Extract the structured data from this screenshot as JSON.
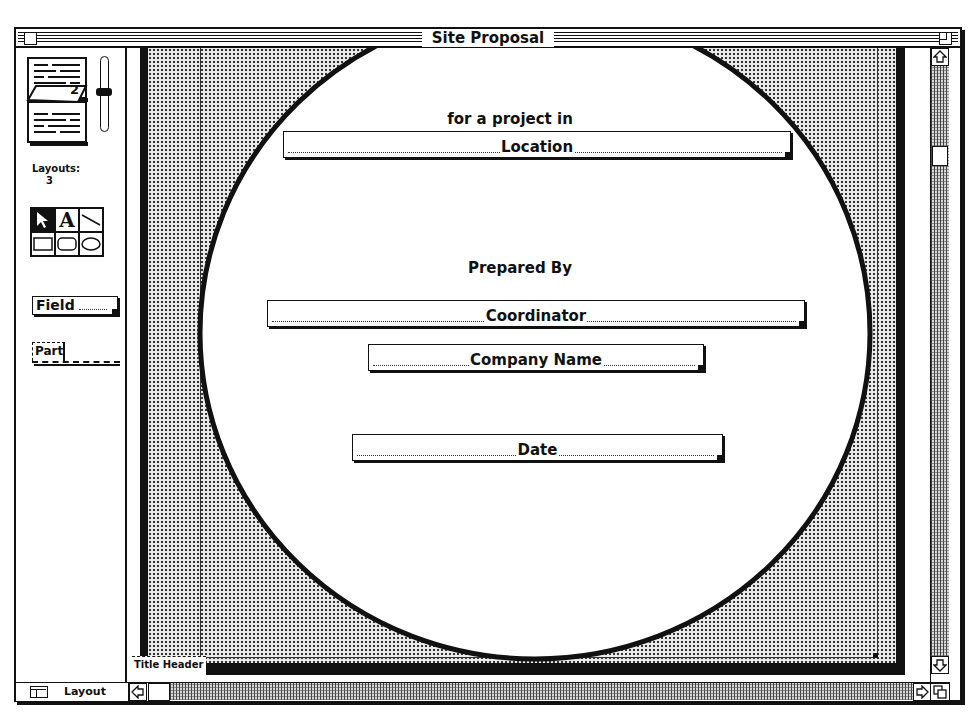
{
  "window": {
    "title": "Site Proposal"
  },
  "left_panel": {
    "layout_book": {
      "page_number": "2"
    },
    "layouts_label": "Layouts:",
    "layouts_count": "3",
    "tools": [
      {
        "name": "pointer",
        "icon": "arrow-pointer-icon",
        "selected": true
      },
      {
        "name": "text",
        "icon": "text-A-icon",
        "label": "A",
        "selected": false
      },
      {
        "name": "line",
        "icon": "line-icon",
        "selected": false
      },
      {
        "name": "rectangle",
        "icon": "rectangle-icon",
        "selected": false
      },
      {
        "name": "rounded-rectangle",
        "icon": "rounded-rectangle-icon",
        "selected": false
      },
      {
        "name": "oval",
        "icon": "oval-icon",
        "selected": false
      }
    ],
    "field_tool_label": "Field",
    "part_tool_label": "Part"
  },
  "layout": {
    "static_texts": {
      "for_project": "for a project in",
      "prepared_by": "Prepared By"
    },
    "fields": [
      {
        "name": "Location"
      },
      {
        "name": "Coordinator"
      },
      {
        "name": "Company Name"
      },
      {
        "name": "Date"
      }
    ],
    "part_label": "Title Header"
  },
  "status_bar": {
    "mode_label": "Layout"
  },
  "colors": {
    "ink": "#111111",
    "paper": "#ffffff",
    "stipple": "#e9e9e9"
  }
}
